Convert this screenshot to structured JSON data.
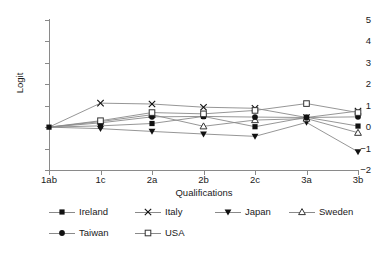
{
  "chart_data": {
    "type": "line",
    "title": "",
    "xlabel": "Qualifications",
    "ylabel": "Logit",
    "categories": [
      "1ab",
      "1c",
      "2a",
      "2b",
      "2c",
      "3a",
      "3b"
    ],
    "ylim": [
      -2,
      5
    ],
    "y_ticks": [
      -2,
      -1,
      0,
      1,
      2,
      3,
      4,
      5
    ],
    "y_tick_labels": [
      "−2",
      "−1",
      "0",
      "1",
      "2",
      "3",
      "4",
      "5"
    ],
    "grid": false,
    "legend_position": "bottom",
    "legend_columns": 4,
    "series": [
      {
        "name": "Ireland",
        "marker": "filled-square",
        "values": [
          0,
          0.06,
          0.17,
          0.5,
          0.02,
          0.46,
          0.05
        ]
      },
      {
        "name": "Italy",
        "marker": "cross",
        "values": [
          0,
          1.12,
          1.08,
          0.93,
          0.88,
          0.45,
          0.75
        ]
      },
      {
        "name": "Japan",
        "marker": "filled-triangle-down",
        "values": [
          0,
          -0.07,
          -0.2,
          -0.32,
          -0.43,
          0.22,
          -1.15
        ]
      },
      {
        "name": "Sweden",
        "marker": "open-triangle-up",
        "values": [
          0,
          0.26,
          0.58,
          0.04,
          0.33,
          0.4,
          -0.26
        ]
      },
      {
        "name": "Taiwan",
        "marker": "filled-circle",
        "values": [
          0,
          0.2,
          0.48,
          0.5,
          0.47,
          0.45,
          0.48
        ]
      },
      {
        "name": "USA",
        "marker": "open-square",
        "values": [
          0,
          0.3,
          0.68,
          0.62,
          0.78,
          1.1,
          0.68
        ]
      }
    ],
    "colors": {
      "line": "#8a8a8a",
      "marker_fill": "#111111",
      "marker_open_fill": "#ffffff",
      "marker_stroke": "#333333",
      "axis": "#8a8a8a",
      "text": "#1a1a1a",
      "background": "#ffffff"
    }
  }
}
